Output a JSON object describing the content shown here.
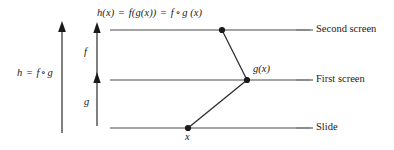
{
  "figure": {
    "type": "ray-diagram",
    "background": "#ffffff",
    "stroke_color": "#3c3c3c",
    "line_color": "#808080",
    "width": 394,
    "height": 150
  },
  "screens": [
    {
      "name": "Second screen",
      "y": 30
    },
    {
      "name": "First screen",
      "y": 80
    },
    {
      "name": "Slide",
      "y": 128
    }
  ],
  "top_label": {
    "h": "h",
    "hx": "(x)",
    "eq1": "=",
    "f_of_gx": "f(g(x))",
    "eq2": "=",
    "f": "f",
    "ring": "∘",
    "g": "g",
    "gx_arg": "(x)"
  },
  "nodes": [
    {
      "name": "image-point",
      "label": "",
      "x": 222,
      "y": 30
    },
    {
      "name": "intermediate-point",
      "label": "g(x)",
      "x": 247,
      "y": 80
    },
    {
      "name": "object-point",
      "label": "x",
      "x": 188,
      "y": 128
    }
  ],
  "node_labels": {
    "gx_g": "g",
    "gx_arg": "(x)",
    "x": "x"
  },
  "arrows": [
    {
      "name": "composite-arrow",
      "label_h": "h",
      "label_eq": "=",
      "label_f": "f",
      "label_ring": "∘",
      "label_g": "g",
      "x": 62,
      "y_from": 132,
      "y_to": 23
    },
    {
      "name": "f-arrow",
      "label": "f",
      "x": 97,
      "y_from": 78,
      "y_to": 24
    },
    {
      "name": "g-arrow",
      "label": "g",
      "x": 97,
      "y_from": 126,
      "y_to": 74
    }
  ]
}
